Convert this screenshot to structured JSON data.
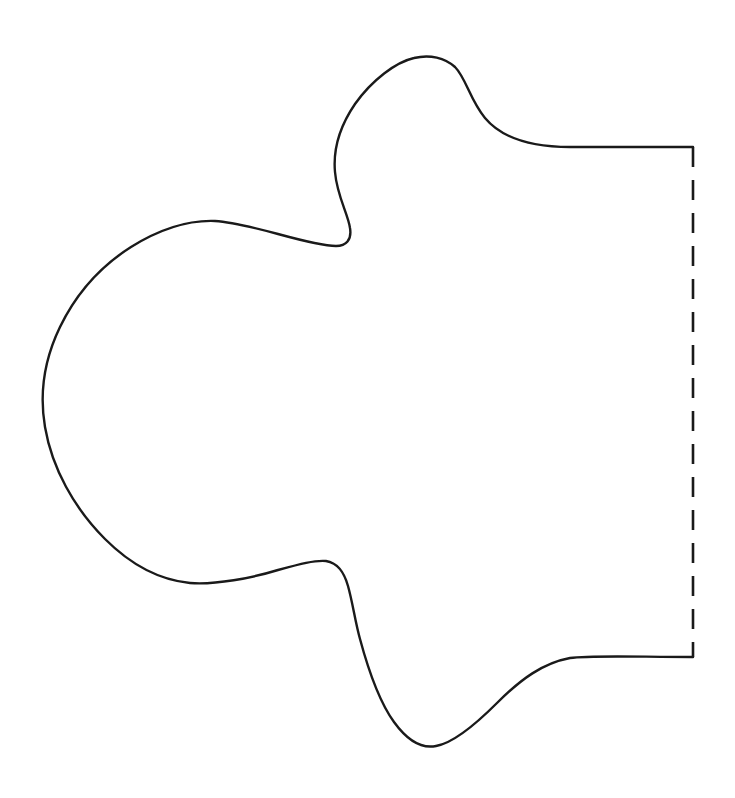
{
  "page": {
    "background_color": "#ffffff",
    "width": 735,
    "height": 798
  },
  "drawing": {
    "stroke_color": "#1a1a1a",
    "stroke_width": 2.4,
    "fill": "none",
    "outline": {
      "name": "shape-outline",
      "style": "solid",
      "path": "M 693 147 L 570 147 C 540 147 505 142 485 118 C 470 100 466 78 455 67 C 445 58 430 54 414 58 C 396 62 372 80 355 104 C 340 126 333 150 335 172 C 337 196 348 214 350 228 C 352 240 346 246 336 246 C 322 246 300 240 278 234 C 252 227 232 222 215 221 C 188 220 160 229 131 247 C 101 266 76 294 60 327 C 45 358 39 392 45 427 C 52 468 74 508 105 539 C 131 565 160 580 190 583 C 215 585 252 578 278 570 C 300 564 315 560 326 561 C 338 563 344 572 348 586 C 353 604 355 621 360 639 C 367 665 378 700 394 722 C 407 740 421 749 436 746 C 454 743 476 724 497 703 C 521 679 543 663 570 658 C 590 655 640 657 693 657"
    },
    "fold_line": {
      "name": "fold-line",
      "style": "dashed",
      "dash_length": 20,
      "gap_length": 13,
      "x": 693,
      "y_start": 147,
      "y_end": 657,
      "path": "M 693 147 L 693 657"
    }
  },
  "labels": {
    "none_visible": ""
  }
}
